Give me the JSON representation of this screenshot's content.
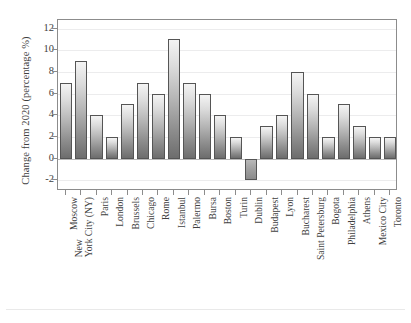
{
  "chart_data": {
    "type": "bar",
    "title": "",
    "xlabel": "",
    "ylabel": "Change from 2020 (percentage %)",
    "ylim": [
      -3,
      12.8
    ],
    "yticks": [
      -2,
      0,
      2,
      4,
      6,
      8,
      10,
      12
    ],
    "grid": true,
    "legend": "none",
    "categories": [
      "Moscow",
      "New York City (NY)",
      "Paris",
      "London",
      "Brussels",
      "Chicago",
      "Rome",
      "Istanbul",
      "Palermo",
      "Bursa",
      "Boston",
      "Turin",
      "Dublin",
      "Budapest",
      "Lyon",
      "Bucharest",
      "Saint Petersburg",
      "Bogota",
      "Philadelphia",
      "Athens",
      "Mexico City",
      "Toronto"
    ],
    "values": [
      7,
      9,
      4,
      2,
      5,
      7,
      6,
      11,
      7,
      6,
      4,
      2,
      -2,
      3,
      4,
      8,
      6,
      2,
      5,
      3,
      2,
      2
    ],
    "bar_style": {
      "gradient_top": "#f4f4f4",
      "gradient_bottom": "#6d6d6d",
      "edge_color": "#555555"
    },
    "axis_color": "#8c8c8c",
    "gridline_color": "#ececed",
    "text_color": "#3f3f3f"
  }
}
